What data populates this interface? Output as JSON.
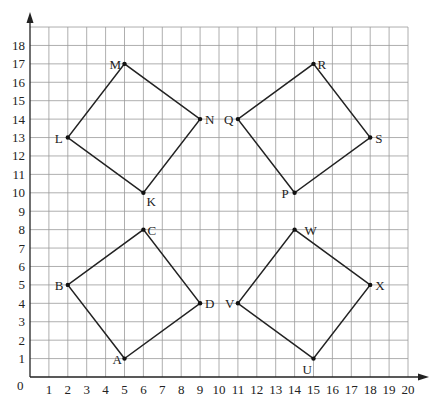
{
  "figure": {
    "origin_label": "0",
    "x_ticks": [
      "1",
      "2",
      "3",
      "4",
      "5",
      "6",
      "7",
      "8",
      "9",
      "10",
      "11",
      "12",
      "13",
      "14",
      "15",
      "16",
      "17",
      "18",
      "19",
      "20"
    ],
    "y_ticks": [
      "1",
      "2",
      "3",
      "4",
      "5",
      "6",
      "7",
      "8",
      "9",
      "10",
      "11",
      "12",
      "13",
      "14",
      "15",
      "16",
      "17",
      "18"
    ],
    "x_range": [
      0,
      20
    ],
    "y_range": [
      0,
      19
    ],
    "colors": {
      "grid": "#9a9a9a",
      "lines": "#222222",
      "background": "#ffffff"
    }
  },
  "shapes": [
    {
      "name": "ABCD",
      "points": [
        {
          "label": "A",
          "x": 5,
          "y": 1,
          "lx": -12,
          "ly": 5
        },
        {
          "label": "B",
          "x": 2,
          "y": 5,
          "lx": -13,
          "ly": 5
        },
        {
          "label": "C",
          "x": 6,
          "y": 8,
          "lx": 4,
          "ly": 5
        },
        {
          "label": "D",
          "x": 9,
          "y": 4,
          "lx": 5,
          "ly": 5
        }
      ]
    },
    {
      "name": "KLMN",
      "points": [
        {
          "label": "K",
          "x": 6,
          "y": 10,
          "lx": 3,
          "ly": 13
        },
        {
          "label": "L",
          "x": 2,
          "y": 13,
          "lx": -13,
          "ly": 5
        },
        {
          "label": "M",
          "x": 5,
          "y": 17,
          "lx": -15,
          "ly": 5
        },
        {
          "label": "N",
          "x": 9,
          "y": 14,
          "lx": 5,
          "ly": 5
        }
      ]
    },
    {
      "name": "PQRS",
      "points": [
        {
          "label": "P",
          "x": 14,
          "y": 10,
          "lx": -13,
          "ly": 5
        },
        {
          "label": "Q",
          "x": 11,
          "y": 14,
          "lx": -14,
          "ly": 5
        },
        {
          "label": "R",
          "x": 15,
          "y": 17,
          "lx": 4,
          "ly": 5
        },
        {
          "label": "S",
          "x": 18,
          "y": 13,
          "lx": 5,
          "ly": 5
        }
      ]
    },
    {
      "name": "UVWX",
      "points": [
        {
          "label": "U",
          "x": 15,
          "y": 1,
          "lx": -11,
          "ly": 15
        },
        {
          "label": "V",
          "x": 11,
          "y": 4,
          "lx": -13,
          "ly": 5
        },
        {
          "label": "W",
          "x": 14,
          "y": 8,
          "lx": 10,
          "ly": 5
        },
        {
          "label": "X",
          "x": 18,
          "y": 5,
          "lx": 5,
          "ly": 5
        }
      ]
    }
  ]
}
